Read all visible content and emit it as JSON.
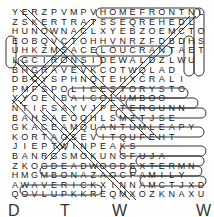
{
  "puzzle": {
    "type": "word-search",
    "rows": [
      "YERZPVMPVHOMEFRONTNL",
      "ZSKERTRATSSEQREHEDL",
      "HUNOWNACLXYEBZOEMCTO",
      "EOBQVCTOHHVNRZFDBDHS",
      "UHKZMSACELOUCRANTAET",
      "LGCIRONSIDEWALDZLWU",
      "BHGRAVEVKCOTWQLAD",
      "DBCYSPHNQTEHXCRALI",
      "PMFSPOLICESTORYSTO",
      "XYOEIBAICOLUMBOO",
      "NTIFSAYVJPETERGUNN",
      "BAHSAEOQHLSMZTJSE",
      "GKACEAMQUANTUMLEAPY",
      "KORTAGSEVITQUFEHT",
      "JIEPTWINPEAKS",
      "BANRGSMOKUNGFUJA",
      "ZKOGDEADWOODEXTERMN",
      "HMGMBONAZAOCFAMILY",
      "AWAVERICKXINNAMCTJXD",
      "QOVLUPKKREQMXOZKNAXU"
    ],
    "found_words": [
      "HOMEFRONT",
      "POLICESTORY",
      "COLUMBO",
      "PETERGUNN",
      "QUANTUMLEAP",
      "TWINPEAKS",
      "KUNGFU",
      "DEADWOOD",
      "DEXTER",
      "FAMILY",
      "MAVERICK",
      "IRONSIDE",
      "LOUGRANT",
      "DALLAS",
      "LOST",
      "LOU",
      "ESTATE"
    ]
  },
  "footer": {
    "partial_text": [
      "D",
      "T",
      "W",
      "W"
    ]
  }
}
